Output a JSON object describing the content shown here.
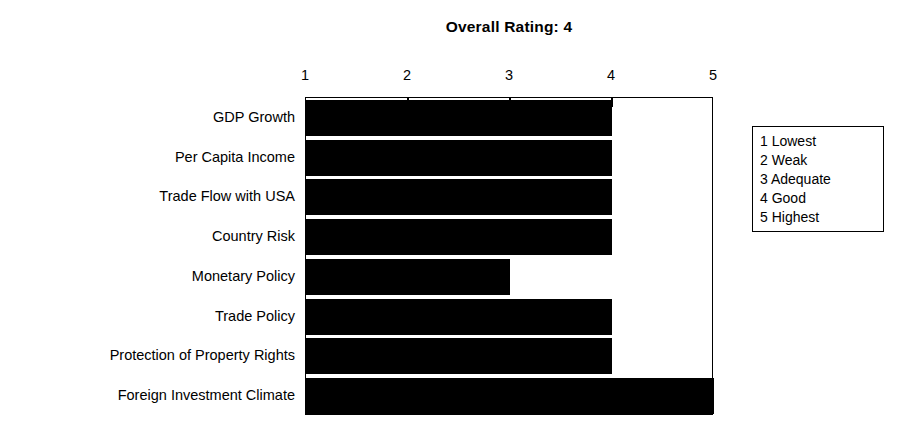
{
  "chart_data": {
    "type": "bar",
    "orientation": "horizontal",
    "title": "Overall Rating: 4",
    "xlabel": "",
    "ylabel": "",
    "xlim": [
      1,
      5
    ],
    "grid": false,
    "legend_position": "right",
    "tick_labels": [
      "1",
      "2",
      "3",
      "4",
      "5"
    ],
    "tick_values": [
      1,
      2,
      3,
      4,
      5
    ],
    "categories": [
      "GDP Growth",
      "Per Capita Income",
      "Trade Flow with USA",
      "Country Risk",
      "Monetary Policy",
      "Trade Policy",
      "Protection of Property Rights",
      "Foreign Investment Climate"
    ],
    "values": [
      4,
      4,
      4,
      4,
      3,
      4,
      4,
      5
    ],
    "bar_color": "#000000",
    "legend_entries": [
      "1 Lowest",
      "2 Weak",
      "3 Adequate",
      "4 Good",
      "5 Highest"
    ]
  }
}
